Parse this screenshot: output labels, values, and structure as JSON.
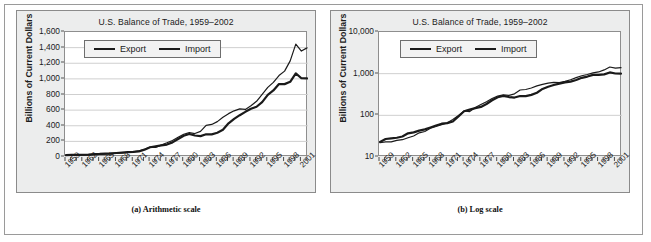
{
  "figure": {
    "panels": [
      {
        "id": "a",
        "caption": "(a) Arithmetic scale",
        "title": "U.S. Balance of Trade, 1959–2002",
        "ylabel": "Billions of Current Dollars",
        "legend": {
          "export_label": "Export",
          "import_label": "Import"
        }
      },
      {
        "id": "b",
        "caption": "(b) Log scale",
        "title": "U.S. Balance of Trade, 1959–2002",
        "ylabel": "Billions of Current Dollars",
        "legend": {
          "export_label": "Export",
          "import_label": "Import"
        }
      }
    ]
  },
  "chart_data": [
    {
      "type": "line",
      "panel": "a",
      "title": "U.S. Balance of Trade, 1959–2002",
      "subtitle": "(a) Arithmetic scale",
      "xlabel": "",
      "ylabel": "Billions of Current Dollars",
      "yscale": "linear",
      "ylim": [
        0,
        1600
      ],
      "yticks": [
        0,
        200,
        400,
        600,
        800,
        1000,
        1200,
        1400,
        1600
      ],
      "ytick_labels": [
        "0",
        "200",
        "400",
        "600",
        "800",
        "1,000",
        "1,200",
        "1,400",
        "1,600"
      ],
      "xlim": [
        1959,
        2002
      ],
      "xticks": [
        1959,
        1962,
        1965,
        1968,
        1971,
        1974,
        1977,
        1980,
        1983,
        1986,
        1989,
        1992,
        1995,
        1998,
        2001
      ],
      "xtick_labels": [
        "1959",
        "1962",
        "1965",
        "1968",
        "1971",
        "1974",
        "1977",
        "1980",
        "1983",
        "1986",
        "1989",
        "1992",
        "1995",
        "1998",
        "2001"
      ],
      "grid": "horizontal",
      "legend_position": "top-left",
      "x": [
        1959,
        1960,
        1961,
        1962,
        1963,
        1964,
        1965,
        1966,
        1967,
        1968,
        1969,
        1970,
        1971,
        1972,
        1973,
        1974,
        1975,
        1976,
        1977,
        1978,
        1979,
        1980,
        1981,
        1982,
        1983,
        1984,
        1985,
        1986,
        1987,
        1988,
        1989,
        1990,
        1991,
        1992,
        1993,
        1994,
        1995,
        1996,
        1997,
        1998,
        1999,
        2000,
        2001,
        2002
      ],
      "series": [
        {
          "name": "Export",
          "color": "#1a1a1a",
          "linewidth": 2.2,
          "values": [
            23,
            27,
            28,
            29,
            31,
            37,
            39,
            43,
            46,
            51,
            57,
            63,
            65,
            71,
            94,
            125,
            137,
            149,
            159,
            187,
            230,
            272,
            294,
            275,
            267,
            291,
            289,
            310,
            349,
            431,
            487,
            535,
            578,
            617,
            643,
            703,
            795,
            852,
            934,
            933,
            963,
            1071,
            1008,
            1006
          ]
        },
        {
          "name": "Import",
          "color": "#1a1a1a",
          "linewidth": 1.2,
          "values": [
            22,
            23,
            23,
            25,
            26,
            29,
            32,
            38,
            41,
            49,
            54,
            60,
            66,
            79,
            99,
            127,
            123,
            154,
            182,
            212,
            253,
            291,
            311,
            300,
            328,
            405,
            417,
            453,
            509,
            555,
            591,
            616,
            609,
            656,
            713,
            801,
            891,
            955,
            1043,
            1099,
            1230,
            1445,
            1356,
            1397
          ]
        }
      ]
    },
    {
      "type": "line",
      "panel": "b",
      "title": "U.S. Balance of Trade, 1959–2002",
      "subtitle": "(b) Log scale",
      "xlabel": "",
      "ylabel": "Billions of Current Dollars",
      "yscale": "log",
      "ylim": [
        10,
        10000
      ],
      "yticks": [
        10,
        100,
        1000,
        10000
      ],
      "ytick_labels": [
        "10",
        "100",
        "1,000",
        "10,000"
      ],
      "xlim": [
        1959,
        2002
      ],
      "xticks": [
        1959,
        1962,
        1965,
        1968,
        1971,
        1974,
        1977,
        1980,
        1983,
        1986,
        1989,
        1992,
        1995,
        1998,
        2001
      ],
      "xtick_labels": [
        "1959",
        "1962",
        "1965",
        "1968",
        "1971",
        "1974",
        "1977",
        "1980",
        "1983",
        "1986",
        "1989",
        "1992",
        "1995",
        "1998",
        "2001"
      ],
      "grid": "horizontal",
      "legend_position": "top-left",
      "x": [
        1959,
        1960,
        1961,
        1962,
        1963,
        1964,
        1965,
        1966,
        1967,
        1968,
        1969,
        1970,
        1971,
        1972,
        1973,
        1974,
        1975,
        1976,
        1977,
        1978,
        1979,
        1980,
        1981,
        1982,
        1983,
        1984,
        1985,
        1986,
        1987,
        1988,
        1989,
        1990,
        1991,
        1992,
        1993,
        1994,
        1995,
        1996,
        1997,
        1998,
        1999,
        2000,
        2001,
        2002
      ],
      "series": [
        {
          "name": "Export",
          "color": "#1a1a1a",
          "linewidth": 2.2,
          "values": [
            23,
            27,
            28,
            29,
            31,
            37,
            39,
            43,
            46,
            51,
            57,
            63,
            65,
            71,
            94,
            125,
            137,
            149,
            159,
            187,
            230,
            272,
            294,
            275,
            267,
            291,
            289,
            310,
            349,
            431,
            487,
            535,
            578,
            617,
            643,
            703,
            795,
            852,
            934,
            933,
            963,
            1071,
            1008,
            1006
          ]
        },
        {
          "name": "Import",
          "color": "#1a1a1a",
          "linewidth": 1.2,
          "values": [
            22,
            23,
            23,
            25,
            26,
            29,
            32,
            38,
            41,
            49,
            54,
            60,
            66,
            79,
            99,
            127,
            123,
            154,
            182,
            212,
            253,
            291,
            311,
            300,
            328,
            405,
            417,
            453,
            509,
            555,
            591,
            616,
            609,
            656,
            713,
            801,
            891,
            955,
            1043,
            1099,
            1230,
            1445,
            1356,
            1397
          ]
        }
      ]
    }
  ]
}
